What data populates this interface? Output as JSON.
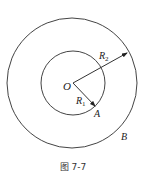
{
  "figure": {
    "caption": "图 7-7",
    "center_label": "O",
    "inner_radius_label": "R",
    "inner_radius_sub": "1",
    "outer_radius_label": "R",
    "outer_radius_sub": "2",
    "inner_point_label": "A",
    "outer_point_label": "B"
  },
  "style": {
    "stroke_color": "#444444"
  }
}
